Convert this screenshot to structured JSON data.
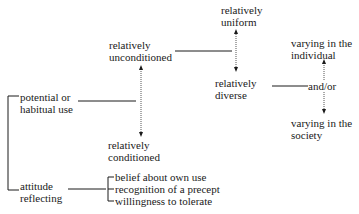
{
  "diagram": {
    "nodes": {
      "relatively_uniform": {
        "line1": "relatively",
        "line2": "uniform"
      },
      "relatively_unconditioned": {
        "line1": "relatively",
        "line2": "unconditioned"
      },
      "relatively_diverse": {
        "line1": "relatively",
        "line2": "diverse"
      },
      "relatively_conditioned": {
        "line1": "relatively",
        "line2": "conditioned"
      },
      "varying_individual": {
        "line1": "varying in the",
        "line2": "individual"
      },
      "and_or": {
        "label": "and/or"
      },
      "varying_society": {
        "line1": "varying in the",
        "line2": "society"
      },
      "potential_use": {
        "line1": "potential or",
        "line2": "habitual use"
      },
      "attitude": {
        "line1": "attitude",
        "line2": "reflecting"
      }
    },
    "attitude_items": [
      "belief about own use",
      "recognition of a precept",
      "willingness to tolerate"
    ],
    "colors": {
      "ink": "#1a1a1a",
      "dotted": "#555555"
    }
  }
}
